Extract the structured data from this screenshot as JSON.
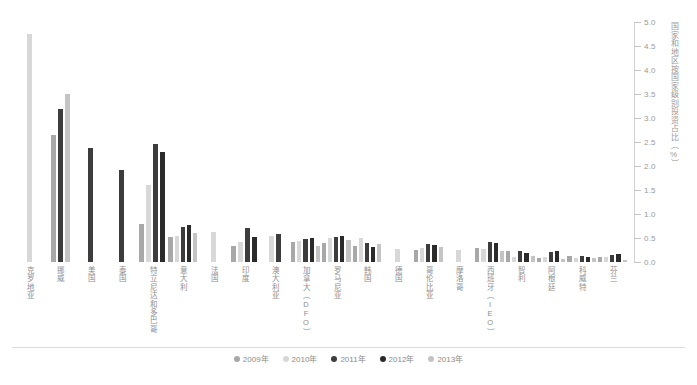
{
  "chart_data": {
    "type": "bar",
    "title": "",
    "xlabel": "",
    "ylabel": "国家和地区按国家级别投资占比（%）",
    "ylim": [
      0.0,
      5.0
    ],
    "ytick_step": 0.5,
    "yticks": [
      "0.0",
      "0.5",
      "1.0",
      "1.5",
      "2.0",
      "2.5",
      "3.0",
      "3.5",
      "4.0",
      "4.5",
      "5.0"
    ],
    "grid": false,
    "legend_position": "bottom",
    "categories": [
      "克罗地亚",
      "挪威",
      "美国",
      "泰国",
      "特立尼达和多巴哥",
      "意大利",
      "法国",
      "印度",
      "澳大利亚",
      "加拿大（DFO）",
      "罗马尼亚",
      "韩国",
      "德国",
      "哥伦比亚",
      "摩洛哥",
      "西班牙（IEO）",
      "智利",
      "阿根廷",
      "科威特",
      "芬兰"
    ],
    "series": [
      {
        "name": "2009年",
        "color": "#a8a8a8",
        "values": [
          null,
          2.65,
          null,
          null,
          0.8,
          0.52,
          null,
          0.33,
          null,
          0.42,
          0.4,
          0.33,
          null,
          0.25,
          null,
          0.3,
          0.22,
          0.08,
          0.12,
          0.1
        ]
      },
      {
        "name": "2010年",
        "color": "#d8d8d8",
        "values": [
          4.75,
          null,
          null,
          null,
          1.6,
          0.55,
          0.62,
          0.42,
          0.55,
          0.44,
          0.5,
          0.5,
          0.27,
          0.3,
          0.24,
          0.28,
          0.1,
          0.1,
          0.09,
          0.1
        ]
      },
      {
        "name": "2011年",
        "color": "#3d3d3d",
        "values": [
          null,
          3.18,
          2.38,
          1.92,
          2.45,
          0.72,
          null,
          0.7,
          0.58,
          0.47,
          0.52,
          0.4,
          null,
          0.38,
          null,
          0.42,
          0.22,
          0.2,
          0.13,
          0.15
        ]
      },
      {
        "name": "2012年",
        "color": "#2b2b2b",
        "values": [
          null,
          null,
          null,
          null,
          2.3,
          0.78,
          null,
          0.52,
          null,
          0.5,
          0.55,
          0.32,
          null,
          0.35,
          null,
          0.4,
          0.18,
          0.22,
          0.11,
          0.16
        ]
      },
      {
        "name": "2013年",
        "color": "#c4c4c4",
        "values": [
          null,
          3.5,
          null,
          null,
          null,
          0.6,
          null,
          null,
          null,
          0.34,
          0.45,
          0.38,
          null,
          0.32,
          null,
          0.22,
          0.12,
          0.06,
          0.08,
          0.05
        ]
      }
    ]
  },
  "axis": {
    "title": "国家和地区按国家级别投资占比（%）"
  },
  "legend": {
    "items": [
      {
        "label": "2009年",
        "color": "#a8a8a8"
      },
      {
        "label": "2010年",
        "color": "#d8d8d8"
      },
      {
        "label": "2011年",
        "color": "#3d3d3d"
      },
      {
        "label": "2012年",
        "color": "#2b2b2b"
      },
      {
        "label": "2013年",
        "color": "#c4c4c4"
      }
    ]
  }
}
